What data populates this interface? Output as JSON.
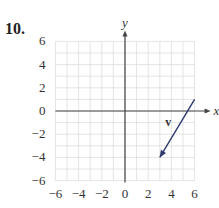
{
  "problem": {
    "number": "10."
  },
  "chart_data": {
    "type": "vector-plot",
    "title": "",
    "xlabel": "x",
    "ylabel": "y",
    "xlim": [
      -6,
      6
    ],
    "ylim": [
      -6,
      6
    ],
    "grid": true,
    "x_ticks": [
      "−6",
      "−4",
      "−2",
      "0",
      "2",
      "4",
      "6"
    ],
    "y_ticks": [
      "6",
      "4",
      "2",
      "0",
      "−2",
      "−4",
      "−6"
    ],
    "vectors": [
      {
        "name": "v",
        "tail": [
          6,
          1
        ],
        "head": [
          3,
          -4
        ]
      }
    ]
  },
  "colors": {
    "axis": "#444444",
    "grid": "#dddddd",
    "vector": "#2e3a6e"
  }
}
